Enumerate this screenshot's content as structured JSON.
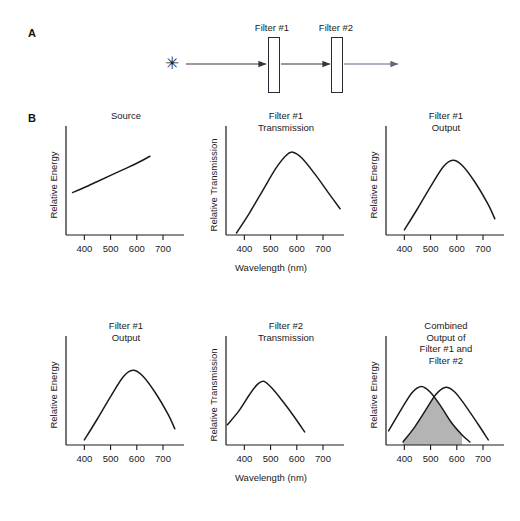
{
  "figure": {
    "panel_a_letter": "A",
    "panel_b_letter": "B",
    "x_axis_label": "Wavelength (nm)"
  },
  "schematic": {
    "source_glyph": "✳",
    "filter1_label": "Filter #1",
    "filter2_label": "Filter #2",
    "beam_color_in": "#33333c",
    "beam_color_out": "#7a6a86",
    "filter_stroke": "#2a2a35"
  },
  "axis": {
    "ticks": [
      "400",
      "500",
      "600",
      "700"
    ],
    "tick_values": [
      400,
      500,
      600,
      700
    ],
    "xmin": 330,
    "xmax": 780
  },
  "chart_data": [
    {
      "id": "source",
      "type": "line",
      "title": "Source",
      "ylabel": "Relative Energy",
      "xlabel": "",
      "xlim": [
        330,
        780
      ],
      "ylim": [
        0,
        1
      ],
      "xticks": [
        400,
        500,
        600,
        700
      ],
      "grid": false,
      "legend": "none",
      "series": [
        {
          "name": "Source spectrum",
          "x": [
            355,
            400,
            450,
            500,
            550,
            600,
            650
          ],
          "y": [
            0.42,
            0.47,
            0.53,
            0.59,
            0.65,
            0.71,
            0.78
          ]
        }
      ]
    },
    {
      "id": "filter1-transmission",
      "type": "line",
      "title": "Filter #1\nTransmission",
      "ylabel": "Relative Transmission",
      "xlabel": "Wavelength (nm)",
      "xlim": [
        330,
        780
      ],
      "ylim": [
        0,
        1
      ],
      "xticks": [
        400,
        500,
        600,
        700
      ],
      "grid": false,
      "legend": "none",
      "series": [
        {
          "name": "Filter #1 transmission",
          "x": [
            370,
            420,
            470,
            520,
            560,
            585,
            620,
            670,
            720,
            765
          ],
          "y": [
            0.02,
            0.22,
            0.44,
            0.66,
            0.79,
            0.82,
            0.76,
            0.6,
            0.42,
            0.26
          ]
        }
      ]
    },
    {
      "id": "filter1-output-top",
      "type": "line",
      "title": "Filter #1\nOutput",
      "ylabel": "Relative Energy",
      "xlabel": "",
      "xlim": [
        330,
        780
      ],
      "ylim": [
        0,
        1
      ],
      "xticks": [
        400,
        500,
        600,
        700
      ],
      "grid": false,
      "legend": "none",
      "series": [
        {
          "name": "Filter #1 output",
          "x": [
            400,
            450,
            500,
            550,
            585,
            620,
            670,
            720,
            745
          ],
          "y": [
            0.05,
            0.26,
            0.48,
            0.68,
            0.74,
            0.69,
            0.52,
            0.3,
            0.16
          ]
        }
      ]
    },
    {
      "id": "filter1-output-bottom",
      "type": "line",
      "title": "Filter #1\nOutput",
      "ylabel": "Relative Energy",
      "xlabel": "",
      "xlim": [
        330,
        780
      ],
      "ylim": [
        0,
        1
      ],
      "xticks": [
        400,
        500,
        600,
        700
      ],
      "grid": false,
      "legend": "none",
      "series": [
        {
          "name": "Filter #1 output",
          "x": [
            400,
            450,
            500,
            550,
            585,
            620,
            670,
            720,
            745
          ],
          "y": [
            0.05,
            0.26,
            0.48,
            0.68,
            0.74,
            0.69,
            0.52,
            0.3,
            0.16
          ]
        }
      ]
    },
    {
      "id": "filter2-transmission",
      "type": "line",
      "title": "Filter #2\nTransmission",
      "ylabel": "Relative Transmission",
      "xlabel": "",
      "xlim": [
        330,
        780
      ],
      "ylim": [
        0,
        1
      ],
      "xticks": [
        400,
        500,
        600,
        700
      ],
      "grid": false,
      "legend": "none",
      "series": [
        {
          "name": "Filter #2 transmission",
          "x": [
            335,
            380,
            420,
            450,
            475,
            510,
            550,
            590,
            630
          ],
          "y": [
            0.2,
            0.34,
            0.5,
            0.6,
            0.63,
            0.55,
            0.42,
            0.28,
            0.13
          ]
        }
      ]
    },
    {
      "id": "combined-output",
      "type": "area",
      "title": "Combined\nOutput of\nFilter #1 and\nFilter #2",
      "ylabel": "Relative Energy",
      "xlabel": "",
      "xlim": [
        330,
        780
      ],
      "ylim": [
        0,
        1
      ],
      "xticks": [
        400,
        500,
        600,
        700
      ],
      "grid": false,
      "legend": "none",
      "shaded_region": {
        "label": "overlap of Filter #1 and Filter #2 outputs",
        "fill_color": "#b4b4b4",
        "x_start": 395,
        "x_end": 620,
        "peak_x": 505
      },
      "series": [
        {
          "name": "Filter #2 output",
          "x": [
            340,
            390,
            430,
            465,
            500,
            540,
            580,
            620,
            650
          ],
          "y": [
            0.14,
            0.36,
            0.52,
            0.58,
            0.52,
            0.38,
            0.22,
            0.1,
            0.03
          ]
        },
        {
          "name": "Filter #1 output",
          "x": [
            395,
            440,
            480,
            520,
            555,
            590,
            630,
            680,
            720
          ],
          "y": [
            0.03,
            0.18,
            0.34,
            0.5,
            0.57,
            0.53,
            0.4,
            0.21,
            0.05
          ]
        }
      ]
    }
  ]
}
